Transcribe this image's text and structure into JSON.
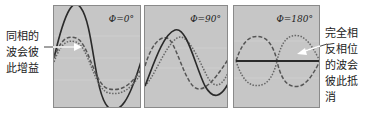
{
  "labels": {
    "left": [
      "同相的",
      "波会彼",
      "此增益"
    ],
    "right": [
      "完全相",
      "反相位",
      "的波会",
      "彼此抵",
      "消"
    ]
  },
  "panels": [
    {
      "id": "phase-0",
      "label": "Φ=0°",
      "phase_deg": 0
    },
    {
      "id": "phase-90",
      "label": "Φ=90°",
      "phase_deg": 90
    },
    {
      "id": "phase-180",
      "label": "Φ=180°",
      "phase_deg": 180
    }
  ],
  "colors": {
    "panel_bg": "#c6c6c6",
    "resultant": "#2a2a2a",
    "dashed": "#555555",
    "dotted": "#666666",
    "arrow": "#ffffff"
  }
}
